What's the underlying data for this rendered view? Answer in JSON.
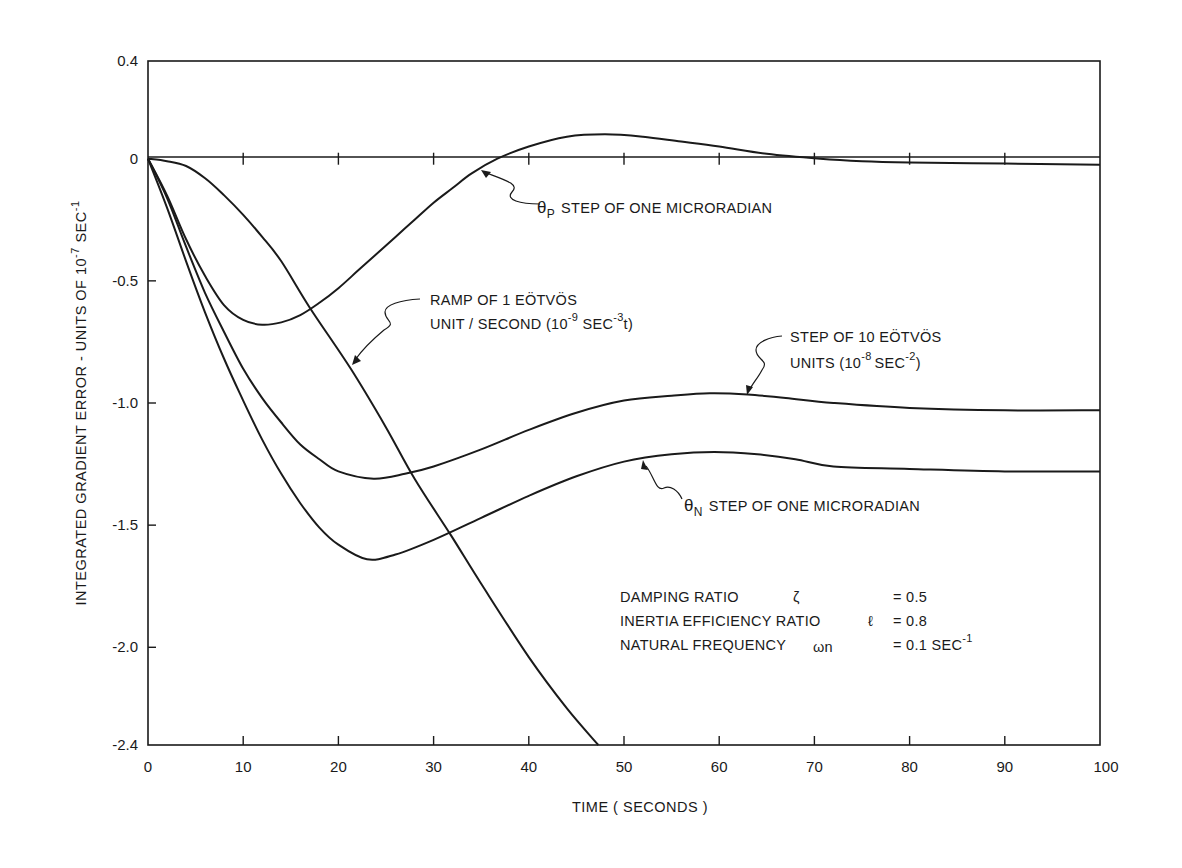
{
  "chart_data": {
    "type": "line",
    "title": "",
    "xlabel": "TIME (SECONDS)",
    "ylabel": "INTEGRATED GRADIENT ERROR - UNITS OF 10^-7 SEC^-1",
    "xlim": [
      0,
      100
    ],
    "ylim": [
      -2.4,
      0.4
    ],
    "x_ticks": [
      0,
      10,
      20,
      30,
      40,
      50,
      60,
      70,
      80,
      90,
      100
    ],
    "y_ticks": [
      0.4,
      0,
      -0.5,
      -1.0,
      -1.5,
      -2.0,
      -2.4
    ],
    "y_tick_labels": [
      "0.4",
      "0",
      "-0.5",
      "-1.0",
      "-1.5",
      "-2.0",
      "-2.4"
    ],
    "grid": false,
    "zero_line": true,
    "legend": "none (curves labelled by annotations)",
    "series": [
      {
        "name": "θP STEP OF ONE MICRORADIAN",
        "x": [
          0,
          2,
          4,
          6,
          8,
          10,
          12,
          14,
          16,
          18,
          20,
          22,
          24,
          26,
          28,
          30,
          32,
          34,
          36.7,
          40,
          44,
          48,
          52,
          56,
          60,
          65,
          70.6,
          75,
          80,
          90,
          100
        ],
        "values": [
          0,
          -0.15,
          -0.33,
          -0.48,
          -0.6,
          -0.66,
          -0.68,
          -0.67,
          -0.64,
          -0.59,
          -0.53,
          -0.46,
          -0.39,
          -0.32,
          -0.25,
          -0.18,
          -0.12,
          -0.06,
          0,
          0.05,
          0.09,
          0.1,
          0.09,
          0.07,
          0.05,
          0.02,
          0,
          -0.01,
          -0.015,
          -0.02,
          -0.025
        ]
      },
      {
        "name": "RAMP OF 1 EÖTVÖS UNIT / SECOND (10^-9 SEC^-3 t)",
        "x": [
          0,
          2,
          4,
          6,
          8,
          10,
          12,
          14,
          17,
          21.3,
          25,
          28,
          31.8,
          35,
          40,
          44,
          47.3
        ],
        "values": [
          0,
          -0.01,
          -0.03,
          -0.08,
          -0.15,
          -0.23,
          -0.32,
          -0.42,
          -0.61,
          -0.86,
          -1.1,
          -1.31,
          -1.54,
          -1.74,
          -2.04,
          -2.25,
          -2.4
        ]
      },
      {
        "name": "STEP OF 10 EÖTVÖS UNITS (10^-8 SEC^-2)",
        "x": [
          0,
          2,
          4,
          6,
          8,
          10,
          12,
          14,
          16,
          18,
          20,
          23.7,
          27,
          30,
          35,
          40,
          45,
          50,
          55,
          59,
          63,
          67,
          72,
          80,
          90,
          100
        ],
        "values": [
          0,
          -0.16,
          -0.36,
          -0.55,
          -0.71,
          -0.86,
          -0.98,
          -1.08,
          -1.17,
          -1.23,
          -1.28,
          -1.31,
          -1.29,
          -1.26,
          -1.19,
          -1.11,
          -1.04,
          -0.99,
          -0.97,
          -0.96,
          -0.965,
          -0.98,
          -1.0,
          -1.02,
          -1.03,
          -1.03
        ]
      },
      {
        "name": "θN STEP OF ONE MICRORADIAN",
        "x": [
          0,
          2,
          4,
          6,
          8,
          10,
          12,
          14,
          16,
          18,
          20,
          23,
          26,
          30,
          35,
          40,
          45,
          50,
          55,
          59.5,
          64,
          68,
          72,
          80,
          90,
          100
        ],
        "values": [
          0,
          -0.2,
          -0.42,
          -0.63,
          -0.82,
          -0.99,
          -1.15,
          -1.29,
          -1.41,
          -1.51,
          -1.58,
          -1.64,
          -1.62,
          -1.56,
          -1.47,
          -1.38,
          -1.3,
          -1.24,
          -1.21,
          -1.2,
          -1.21,
          -1.23,
          -1.26,
          -1.27,
          -1.28,
          -1.28
        ]
      }
    ],
    "annotations": [
      {
        "id": "theta_p",
        "symbol": "θ",
        "subscript": "P",
        "text": "STEP OF ONE MICRORADIAN",
        "points_to": [
          35,
          -0.03
        ]
      },
      {
        "id": "ramp",
        "line1": "RAMP OF 1 EÖTVÖS",
        "line2_a": "UNIT / SECOND (10",
        "line2_sup1": "-9",
        "line2_b": " SEC",
        "line2_sup2": "-3",
        "line2_c": "t)",
        "points_to": [
          21.3,
          -0.86
        ]
      },
      {
        "id": "step10",
        "line1": "STEP OF 10 EÖTVÖS",
        "line2_a": "UNITS (10",
        "line2_sup1": "-8",
        "line2_b": "SEC",
        "line2_sup2": "-2",
        "line2_c": ")",
        "points_to": [
          59,
          -0.96
        ]
      },
      {
        "id": "theta_n",
        "symbol": "θ",
        "subscript": "N",
        "text": "STEP OF ONE MICRORADIAN",
        "points_to": [
          50,
          -1.24
        ]
      }
    ],
    "parameters": [
      {
        "label": "DAMPING RATIO",
        "symbol": "ζ",
        "value": "= 0.5"
      },
      {
        "label": "INERTIA EFFICIENCY RATIO",
        "symbol": "ℓ",
        "value": "= 0.8"
      },
      {
        "label": "NATURAL FREQUENCY",
        "symbol": "ωn",
        "value": "= 0.1 SEC",
        "value_sup": "-1"
      }
    ],
    "colors": {
      "ink": "#1a1a1a",
      "background": "#ffffff"
    }
  },
  "labels": {
    "xlabel": "TIME ( SECONDS )",
    "ylabel_main": "INTEGRATED GRADIENT ERROR - UNITS OF 10",
    "ylabel_sup1": "-7",
    "ylabel_tail": " SEC",
    "ylabel_sup2": "-1"
  }
}
